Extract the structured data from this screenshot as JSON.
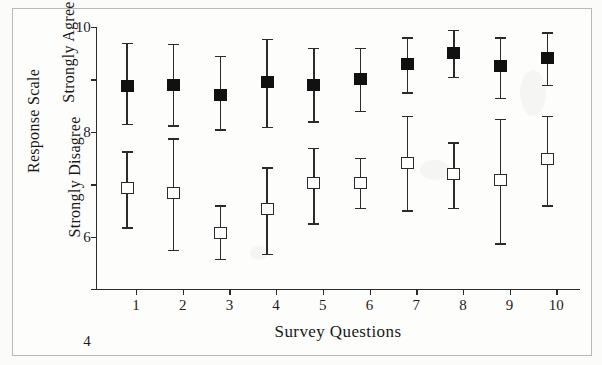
{
  "chart_data": {
    "type": "scatter",
    "title": "",
    "xlabel": "Survey Questions",
    "ylabel": "Response Scale",
    "ylabel_top": "Strongly Agree",
    "ylabel_bottom": "Strongly Disagree",
    "categories": [
      "1",
      "2",
      "3",
      "4",
      "5",
      "6",
      "7",
      "8",
      "9",
      "10"
    ],
    "x_tick_labels": [
      "1",
      "2",
      "3",
      "4",
      "5",
      "6",
      "7",
      "8",
      "9",
      "10"
    ],
    "y_tick_labels": [
      "0",
      "2",
      "4",
      "6",
      "8",
      "10"
    ],
    "y_tick_values": [
      0,
      2,
      4,
      6,
      8,
      10
    ],
    "ylim": [
      0,
      10
    ],
    "grid": false,
    "legend": "none",
    "error_bars": "whiskers with caps",
    "series": [
      {
        "name": "Filled squares (upper series)",
        "marker": "filled-square",
        "color": "#111111",
        "values": [
          7.75,
          7.8,
          7.4,
          7.9,
          7.8,
          8.0,
          8.6,
          9.0,
          8.5,
          8.8
        ],
        "err_low": [
          6.3,
          6.25,
          6.1,
          6.2,
          6.4,
          6.8,
          7.5,
          8.1,
          7.3,
          7.8
        ],
        "err_high": [
          9.4,
          9.35,
          8.9,
          9.55,
          9.2,
          9.2,
          9.6,
          9.9,
          9.6,
          9.8
        ]
      },
      {
        "name": "Open squares (lower series)",
        "marker": "open-square",
        "color": "#ffffff",
        "values": [
          3.85,
          3.65,
          2.15,
          3.05,
          4.05,
          4.05,
          4.8,
          4.4,
          4.15,
          4.95
        ],
        "err_low": [
          2.35,
          1.5,
          1.15,
          1.35,
          2.5,
          3.1,
          3.0,
          3.1,
          1.75,
          3.2
        ],
        "err_high": [
          5.25,
          5.75,
          3.2,
          4.65,
          5.4,
          5.0,
          6.6,
          5.6,
          6.5,
          6.6
        ]
      }
    ]
  }
}
